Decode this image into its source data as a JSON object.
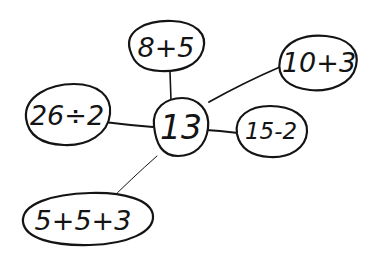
{
  "diagram": {
    "type": "hand-drawn spider / mind map",
    "colors": {
      "ink": "#141414",
      "background": "#ffffff"
    },
    "center": {
      "id": "center",
      "label": "13"
    },
    "nodes": [
      {
        "id": "n1",
        "label": "8+5"
      },
      {
        "id": "n2",
        "label": "10+3"
      },
      {
        "id": "n3",
        "label": "26÷2"
      },
      {
        "id": "n4",
        "label": "15-2"
      },
      {
        "id": "n5",
        "label": "5+5+3"
      }
    ],
    "edges": [
      {
        "from": "center",
        "to": "n1"
      },
      {
        "from": "center",
        "to": "n2"
      },
      {
        "from": "center",
        "to": "n3"
      },
      {
        "from": "center",
        "to": "n4"
      },
      {
        "from": "center",
        "to": "n5"
      }
    ]
  }
}
